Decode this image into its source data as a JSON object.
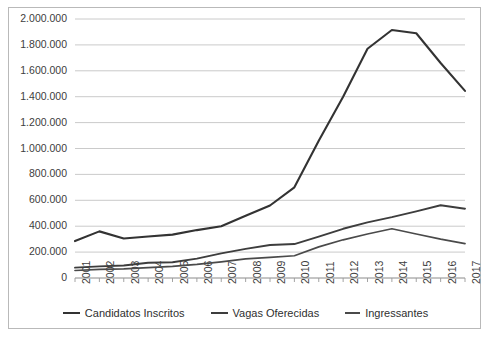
{
  "top_cropped_text": "",
  "bottom_cropped_caption": "",
  "chart_data": {
    "type": "line",
    "title": "",
    "xlabel": "",
    "ylabel": "",
    "x": [
      "2001",
      "2002",
      "2003",
      "2004",
      "2005",
      "2006",
      "2007",
      "2008",
      "2009",
      "2010",
      "2011",
      "2012",
      "2013",
      "2014",
      "2015",
      "2016",
      "2017"
    ],
    "ylim": [
      0,
      2000000
    ],
    "ytick_labels": [
      "2.000.000",
      "1.800.000",
      "1.600.000",
      "1.400.000",
      "1.200.000",
      "1.000.000",
      "800.000",
      "600.000",
      "400.000",
      "200.000",
      "0"
    ],
    "ytick_values": [
      2000000,
      1800000,
      1600000,
      1400000,
      1200000,
      1000000,
      800000,
      600000,
      400000,
      200000,
      0
    ],
    "grid": true,
    "legend_position": "bottom",
    "series": [
      {
        "name": "Candidatos Inscritos",
        "color": "#333333",
        "values": [
          285000,
          360000,
          305000,
          320000,
          335000,
          370000,
          400000,
          480000,
          560000,
          700000,
          1060000,
          1400000,
          1770000,
          1915000,
          1890000,
          1660000,
          1445000
        ]
      },
      {
        "name": "Vagas Oferecidas",
        "color": "#3d3d3d",
        "values": [
          80000,
          90000,
          97000,
          118000,
          122000,
          150000,
          190000,
          225000,
          255000,
          262000,
          320000,
          380000,
          430000,
          470000,
          515000,
          562000,
          535000
        ]
      },
      {
        "name": "Ingressantes",
        "color": "#4a4a4a",
        "values": [
          58000,
          66000,
          70000,
          80000,
          90000,
          105000,
          125000,
          148000,
          160000,
          172000,
          240000,
          295000,
          340000,
          380000,
          340000,
          300000,
          265000
        ]
      }
    ]
  },
  "legend": {
    "items": [
      {
        "label": "Candidatos Inscritos"
      },
      {
        "label": "Vagas Oferecidas"
      },
      {
        "label": "Ingressantes"
      }
    ]
  }
}
